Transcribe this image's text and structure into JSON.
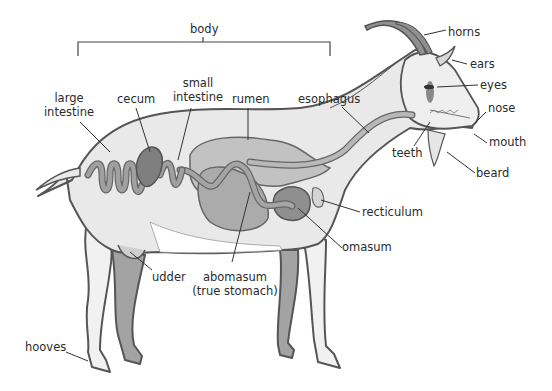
{
  "diagram": {
    "title_bracket_label": "body",
    "labels": {
      "body": "body",
      "horns": "horns",
      "ears": "ears",
      "eyes": "eyes",
      "nose": "nose",
      "mouth": "mouth",
      "beard": "beard",
      "teeth": "teeth",
      "esophagus": "esophagus",
      "rumen": "rumen",
      "small_intestine_1": "small",
      "small_intestine_2": "intestine",
      "cecum": "cecum",
      "large_intestine_1": "large",
      "large_intestine_2": "intestine",
      "recticulum": "recticulum",
      "omasum": "omasum",
      "abomasum_1": "abomasum",
      "abomasum_2": "(true stomach)",
      "udder": "udder",
      "hooves": "hooves"
    },
    "colors": {
      "outline": "#555555",
      "body_fill": "#e9e9e9",
      "organ_light": "#bdbdbd",
      "organ_mid": "#9a9a9a",
      "organ_dark": "#7c7c7c",
      "label_text": "#2b2b2b",
      "leader_line": "#333333"
    }
  }
}
